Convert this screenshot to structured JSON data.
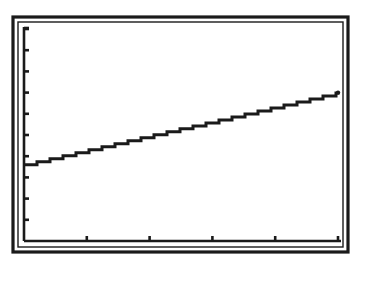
{
  "screen": {
    "type": "graphing-calculator-window",
    "colors": {
      "background": "#ffffff",
      "ink": "#1a1a1a"
    }
  },
  "chart_data": {
    "type": "line",
    "title": "",
    "xlabel": "",
    "ylabel": "",
    "grid": false,
    "legend": null,
    "xlim": [
      0,
      5
    ],
    "ylim": [
      0,
      10
    ],
    "x_ticks": [
      1,
      2,
      3,
      4,
      5
    ],
    "y_ticks": [
      1,
      2,
      3,
      4,
      5,
      6,
      7,
      8,
      9,
      10
    ],
    "tick_labels_shown": false,
    "series": [
      {
        "name": "line",
        "x": [
          0,
          5
        ],
        "y": [
          3.6,
          7.0
        ]
      }
    ],
    "pixel_layout": {
      "outer_frame": [
        13,
        17,
        348,
        252
      ],
      "inner_frame": [
        18,
        22,
        343,
        247
      ],
      "origin_px": [
        24,
        241
      ],
      "x_unit_px": 62.8,
      "y_unit_px": 21.2
    }
  }
}
